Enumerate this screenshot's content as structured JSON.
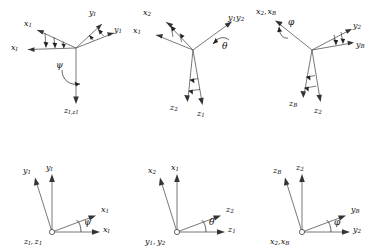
{
  "figure": {
    "background_color": "#ffffff",
    "axis_color": "#555555",
    "label_color": "#111111",
    "panel_count": 6
  },
  "panels": [
    {
      "id": "top-left-yaw",
      "view": "3d-perspective",
      "angle_symbol": "ψ",
      "rotation": "yaw about z",
      "labels": {
        "x_rotated": "x",
        "x_rotated_sub": "1",
        "x_original": "x",
        "x_original_sub": "I",
        "y_rotated": "y",
        "y_rotated_sub": "1",
        "y_original": "y",
        "y_original_sub": "I",
        "z_shared": "z",
        "z_shared_sub": "I,z1",
        "z_shared_full": "zI,z1"
      }
    },
    {
      "id": "top-middle-pitch",
      "view": "3d-perspective",
      "angle_symbol": "θ",
      "rotation": "pitch about y",
      "labels": {
        "x_rotated": "x",
        "x_rotated_sub": "2",
        "x_original": "x",
        "x_original_sub": "1",
        "y_shared": "y",
        "y_shared_sub": "1",
        "y_shared_second": "y",
        "y_shared_second_sub": "2",
        "z_rotated": "z",
        "z_rotated_sub": "2",
        "z_original": "z",
        "z_original_sub": "1"
      }
    },
    {
      "id": "top-right-roll",
      "view": "3d-perspective",
      "angle_symbol": "φ",
      "rotation": "roll about x",
      "labels": {
        "x_shared": "x",
        "x_shared_sub": "2",
        "x_shared_second": "x",
        "x_shared_second_sub": "B",
        "y_original": "y",
        "y_original_sub": "2",
        "y_rotated": "y",
        "y_rotated_sub": "B",
        "z_rotated": "z",
        "z_rotated_sub": "B",
        "z_original": "z",
        "z_original_sub": "2"
      }
    },
    {
      "id": "bottom-left-yaw-plane",
      "view": "2d-plane",
      "angle_symbol": "ψ",
      "rotation": "yaw plane, z out of page",
      "labels": {
        "vertical_rotated": "y",
        "vertical_rotated_sub": "1",
        "vertical_original": "y",
        "vertical_original_sub": "I",
        "horizontal_rotated": "x",
        "horizontal_rotated_sub": "1",
        "horizontal_original": "x",
        "horizontal_original_sub": "I",
        "origin_first": "z",
        "origin_first_sub": "I",
        "origin_second": "z",
        "origin_second_sub": "1"
      }
    },
    {
      "id": "bottom-middle-pitch-plane",
      "view": "2d-plane",
      "angle_symbol": "θ",
      "rotation": "pitch plane, y out of page",
      "labels": {
        "vertical_rotated": "x",
        "vertical_rotated_sub": "2",
        "vertical_original": "x",
        "vertical_original_sub": "1",
        "horizontal_rotated": "z",
        "horizontal_rotated_sub": "2",
        "horizontal_original": "z",
        "horizontal_original_sub": "1",
        "origin_first": "y",
        "origin_first_sub": "1",
        "origin_second": "y",
        "origin_second_sub": "2"
      }
    },
    {
      "id": "bottom-right-roll-plane",
      "view": "2d-plane",
      "angle_symbol": "φ",
      "rotation": "roll plane, x out of page",
      "labels": {
        "vertical_rotated": "z",
        "vertical_rotated_sub": "B",
        "vertical_original": "z",
        "vertical_original_sub": "2",
        "horizontal_rotated": "y",
        "horizontal_rotated_sub": "B",
        "horizontal_original": "y",
        "horizontal_original_sub": "2",
        "origin_first": "x",
        "origin_first_sub": "2",
        "origin_second": "x",
        "origin_second_sub": "B"
      }
    }
  ]
}
